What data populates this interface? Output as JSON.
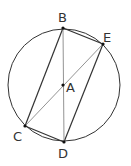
{
  "diagram": {
    "title": "",
    "circle": {
      "cx": 64,
      "cy": 85,
      "r": 56
    },
    "points": [
      {
        "id": "B",
        "label": "B",
        "x": 63,
        "y": 28,
        "lx": 58,
        "ly": 22
      },
      {
        "id": "E",
        "label": "E",
        "x": 103,
        "y": 44,
        "lx": 104,
        "ly": 42
      },
      {
        "id": "A",
        "label": "A",
        "x": 63,
        "y": 85,
        "lx": 66,
        "ly": 92
      },
      {
        "id": "C",
        "label": "C",
        "x": 25,
        "y": 126,
        "lx": 13,
        "ly": 141
      },
      {
        "id": "D",
        "label": "D",
        "x": 64,
        "y": 142,
        "lx": 58,
        "ly": 158
      }
    ],
    "segments": [
      [
        "B",
        "C"
      ],
      [
        "B",
        "E"
      ],
      [
        "E",
        "D"
      ],
      [
        "C",
        "D"
      ],
      [
        "B",
        "D"
      ],
      [
        "C",
        "E"
      ]
    ]
  }
}
